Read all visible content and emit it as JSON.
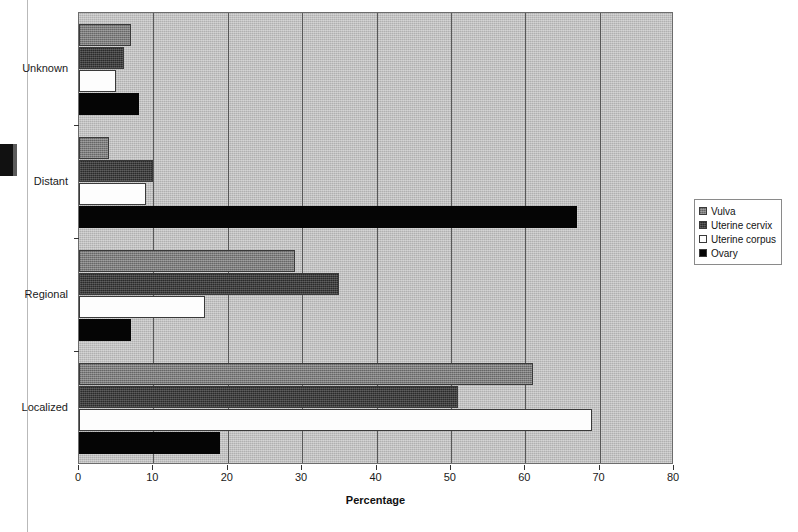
{
  "chart_data": {
    "type": "bar",
    "orientation": "horizontal",
    "title": "",
    "xlabel": "Percentage",
    "ylabel": "",
    "xlim": [
      0,
      80
    ],
    "xticks": [
      0,
      10,
      20,
      30,
      40,
      50,
      60,
      70,
      80
    ],
    "xtick_labels": [
      "0",
      "10",
      "20",
      "30",
      "40",
      "50",
      "60",
      "70",
      "80"
    ],
    "grid": true,
    "legend_position": "right",
    "categories": [
      "Localized",
      "Regional",
      "Distant",
      "Unknown"
    ],
    "series": [
      {
        "name": "Vulva",
        "color": "#7d7d7d",
        "values": [
          61,
          29,
          4,
          7
        ]
      },
      {
        "name": "Uterine cervix",
        "color": "#2a2a2a",
        "values": [
          51,
          35,
          10,
          6
        ]
      },
      {
        "name": "Uterine corpus",
        "color": "#ffffff",
        "values": [
          69,
          17,
          9,
          5
        ]
      },
      {
        "name": "Ovary",
        "color": "#050505",
        "values": [
          19,
          7,
          67,
          8
        ]
      }
    ]
  },
  "legend": {
    "items": [
      {
        "label": "Vulva"
      },
      {
        "label": "Uterine cervix"
      },
      {
        "label": "Uterine corpus"
      },
      {
        "label": "Ovary"
      }
    ]
  },
  "axes": {
    "x_title": "Percentage",
    "x_labels": [
      "0",
      "10",
      "20",
      "30",
      "40",
      "50",
      "60",
      "70",
      "80"
    ],
    "y_labels": [
      "Unknown",
      "Distant",
      "Regional",
      "Localized"
    ]
  }
}
